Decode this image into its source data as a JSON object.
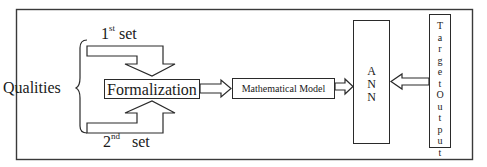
{
  "diagram": {
    "inputs_label": "Qualities",
    "sets": [
      {
        "number": "1",
        "suffix": "st",
        "word": "set"
      },
      {
        "number": "2",
        "suffix": "nd",
        "word": "set"
      }
    ],
    "nodes": {
      "formalization": "Formalization",
      "mathematical_model": "Mathematical Model",
      "ann": [
        "A",
        "N",
        "N"
      ],
      "target_output": [
        "T",
        "a",
        "r",
        "g",
        "e",
        "t",
        "O",
        "u",
        "t",
        "p",
        "u",
        "t"
      ]
    },
    "edges": [
      {
        "from": "1st set",
        "to": "Formalization"
      },
      {
        "from": "2nd set",
        "to": "Formalization"
      },
      {
        "from": "Formalization",
        "to": "Mathematical Model"
      },
      {
        "from": "Mathematical Model",
        "to": "ANN"
      },
      {
        "from": "Target Output",
        "to": "ANN"
      }
    ],
    "colors": {
      "stroke": "#2a2a2a",
      "background": "#ffffff",
      "frame": "#3a3a3a"
    }
  }
}
